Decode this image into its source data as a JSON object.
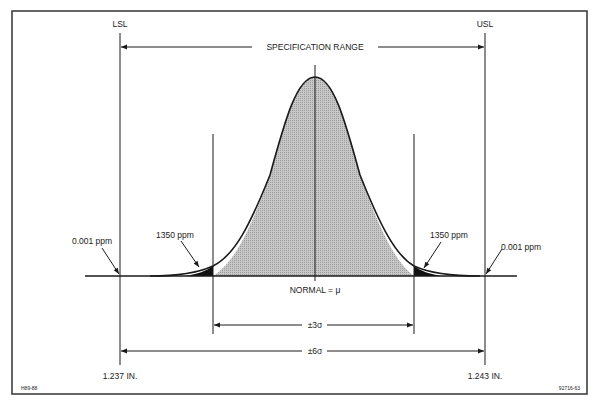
{
  "diagram": {
    "labels": {
      "lsl": "LSL",
      "usl": "USL",
      "spec_range": "SPECIFICATION RANGE",
      "normal_mean": "NORMAL =  μ",
      "plus_minus_3_sigma": "±3σ",
      "plus_minus_6_sigma": "±6σ",
      "lsl_value": "1.237 IN.",
      "usl_value": "1.243 IN.",
      "left_tail_3sigma": "1350 ppm",
      "right_tail_3sigma": "1350 ppm",
      "left_tail_6sigma": "0.001 ppm",
      "right_tail_6sigma": "0.001 ppm",
      "figure_code_left": "H89-88",
      "figure_code_right": "92716-63"
    },
    "colors": {
      "line": "#1a1a1a",
      "curve_fill": "#bdbdbd",
      "tail_fill": "#111111",
      "border": "#333333"
    }
  }
}
